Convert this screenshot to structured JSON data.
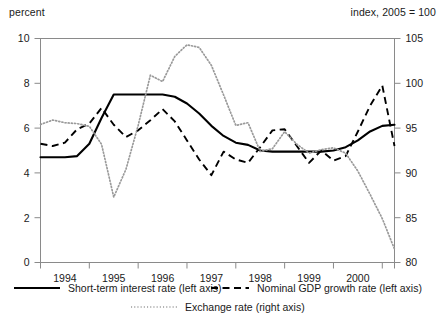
{
  "chart_data": {
    "type": "line",
    "title": "",
    "xlabel": "",
    "ylabel_left": "percent",
    "ylabel_right": "index, 2005 = 100",
    "grid": false,
    "legend_position": "bottom",
    "xlim": [
      1993.5,
      2000.75
    ],
    "ylim_left": [
      0,
      10
    ],
    "ylim_right": [
      80,
      105
    ],
    "yticks_left": [
      "0",
      "2",
      "4",
      "6",
      "8",
      "10"
    ],
    "yticks_right": [
      "80",
      "85",
      "90",
      "95",
      "100",
      "105"
    ],
    "xticks": [
      "1994",
      "1995",
      "1996",
      "1997",
      "1998",
      "1999",
      "2000"
    ],
    "series": [
      {
        "name": "Short-term interest  rate (left axis)",
        "axis": "left",
        "style": "solid",
        "x": [
          1993.5,
          1993.75,
          1994.0,
          1994.25,
          1994.5,
          1994.75,
          1995.0,
          1995.25,
          1995.5,
          1995.75,
          1996.0,
          1996.25,
          1996.5,
          1996.75,
          1997.0,
          1997.25,
          1997.5,
          1997.75,
          1998.0,
          1998.25,
          1998.5,
          1998.75,
          1999.0,
          1999.25,
          1999.5,
          1999.75,
          2000.0,
          2000.25,
          2000.5,
          2000.75
        ],
        "y": [
          4.7,
          4.7,
          4.7,
          4.75,
          5.3,
          6.45,
          7.5,
          7.5,
          7.5,
          7.5,
          7.5,
          7.4,
          7.1,
          6.65,
          6.1,
          5.65,
          5.35,
          5.25,
          5.0,
          4.95,
          4.95,
          4.95,
          4.95,
          4.95,
          5.0,
          5.15,
          5.45,
          5.85,
          6.1,
          6.15
        ]
      },
      {
        "name": "Nominal GDP growth rate  (left axis)",
        "axis": "left",
        "style": "dashed",
        "x": [
          1993.5,
          1993.75,
          1994.0,
          1994.25,
          1994.5,
          1994.75,
          1995.0,
          1995.25,
          1995.5,
          1995.75,
          1996.0,
          1996.25,
          1996.5,
          1996.75,
          1997.0,
          1997.25,
          1997.5,
          1997.75,
          1998.0,
          1998.25,
          1998.5,
          1998.75,
          1999.0,
          1999.25,
          1999.5,
          1999.75,
          2000.0,
          2000.25,
          2000.5,
          2000.75
        ],
        "y": [
          5.3,
          5.2,
          5.35,
          5.95,
          6.2,
          6.9,
          6.15,
          5.6,
          5.9,
          6.35,
          6.85,
          6.3,
          5.45,
          4.6,
          3.9,
          4.95,
          4.6,
          4.45,
          5.15,
          5.9,
          5.95,
          5.2,
          4.45,
          5.0,
          4.55,
          4.75,
          5.85,
          7.0,
          7.9,
          5.2
        ]
      },
      {
        "name": "Exchange rate (right axis)",
        "axis": "right",
        "style": "dotted",
        "x": [
          1993.5,
          1993.75,
          1994.0,
          1994.25,
          1994.5,
          1994.75,
          1995.0,
          1995.25,
          1995.5,
          1995.75,
          1996.0,
          1996.25,
          1996.5,
          1996.75,
          1997.0,
          1997.25,
          1997.5,
          1997.75,
          1998.0,
          1998.25,
          1998.5,
          1998.75,
          1999.0,
          1999.25,
          1999.5,
          1999.75,
          2000.0,
          2000.25,
          2000.5,
          2000.75
        ],
        "y": [
          95.4,
          95.9,
          95.6,
          95.5,
          95.2,
          93.2,
          87.3,
          90.4,
          95.3,
          100.9,
          100.2,
          103.0,
          104.3,
          104.0,
          102.0,
          98.7,
          95.3,
          95.6,
          92.4,
          92.7,
          94.6,
          93.2,
          92.2,
          92.6,
          92.8,
          92.2,
          90.2,
          87.6,
          84.9,
          81.5
        ]
      }
    ]
  },
  "legend": [
    {
      "label": "Short-term interest  rate (left axis)",
      "style": "solid"
    },
    {
      "label": "Nominal GDP growth rate  (left axis)",
      "style": "dashed"
    },
    {
      "label": "Exchange rate (right axis)",
      "style": "dotted"
    }
  ],
  "captions": {
    "left": "percent",
    "right": "index, 2005 = 100"
  }
}
